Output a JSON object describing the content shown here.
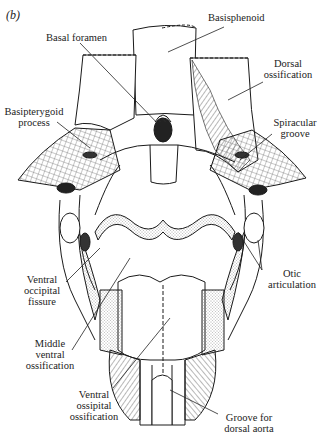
{
  "figure": {
    "panel_label": "(b)",
    "labels": {
      "basisphenoid": "Basisphenoid",
      "basal_foramen": "Basal foramen",
      "dorsal_ossification_1": "Dorsal",
      "dorsal_ossification_2": "ossification",
      "basipterygoid_process_1": "Basipterygoid",
      "basipterygoid_process_2": "process",
      "spiracular_groove_1": "Spiracular",
      "spiracular_groove_2": "groove",
      "ventral_occipital_fissure_1": "Ventral",
      "ventral_occipital_fissure_2": "occipital",
      "ventral_occipital_fissure_3": "fissure",
      "otic_articulation_1": "Otic",
      "otic_articulation_2": "articulation",
      "middle_ventral_ossification_1": "Middle",
      "middle_ventral_ossification_2": "ventral",
      "middle_ventral_ossification_3": "ossification",
      "ventral_ossipital_ossification_1": "Ventral",
      "ventral_ossipital_ossification_2": "ossipital",
      "ventral_ossipital_ossification_3": "ossification",
      "groove_dorsal_aorta_1": "Groove for",
      "groove_dorsal_aorta_2": "dorsal aorta"
    }
  }
}
